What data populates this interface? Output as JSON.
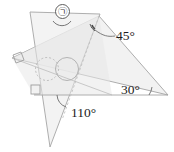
{
  "figure": {
    "kind": "geometry-diagram",
    "canvas": {
      "width": 174,
      "height": 152
    },
    "colors": {
      "outline": "#9a9a9a",
      "outline_light": "#b8b8b8",
      "fill_light": "#f1f1f1",
      "fill_overlap": "#e4e4e4",
      "text": "#1c1c1c",
      "leader": "#6f6f6f",
      "background": "#ffffff"
    },
    "labels": {
      "angle_unknown_marker": "㉠",
      "angle_45": "45°",
      "angle_30": "30°",
      "angle_110": "110°"
    },
    "angle_values": {
      "unknown": null,
      "top_right": 45,
      "far_right": 30,
      "lower_middle": 110
    },
    "marks": {
      "right_angle_count": 2,
      "right_angle_positions": [
        "upper-left-vertex",
        "lower-left-interior"
      ],
      "dashed_circle_count": 1,
      "solid_circle_count": 1
    }
  }
}
